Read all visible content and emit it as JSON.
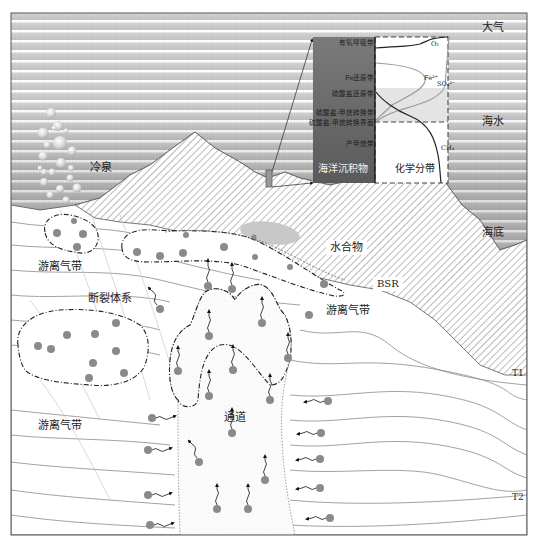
{
  "figure": {
    "type": "schematic cross-section"
  },
  "regions": {
    "atmosphere": "大气",
    "seawater": "海水",
    "seafloor": "海底",
    "cold_seep": "冷泉",
    "hydrate": "水合物",
    "bsr": "BSR",
    "fracture_system": "断裂体系",
    "free_gas_zone_left_top": "游离气带",
    "free_gas_zone_right": "游离气带",
    "free_gas_zone_left_bottom": "游离气带",
    "conduit": "通道",
    "horizon_t1": "T1",
    "horizon_t2": "T2"
  },
  "inset": {
    "left_title": "海洋沉积物",
    "right_title": "化学分带",
    "zones": [
      "有氧呼吸带",
      "Fe还原带",
      "硫酸盐还原带",
      "硫酸盐-甲烷转换带",
      "硫酸盐-甲烷转换界面",
      "产甲烷带"
    ],
    "species": {
      "o2": "O₂",
      "fe": "Fe²⁺",
      "so4": "SO₄²⁻",
      "ch4": "CH₄"
    }
  },
  "colors": {
    "seawater": "#a9a9a9",
    "sediment_column": "#6e6e6e",
    "gas_bubble": "#8a8a8a",
    "hydrate": "#c8c8c8",
    "frame": "#555555"
  }
}
